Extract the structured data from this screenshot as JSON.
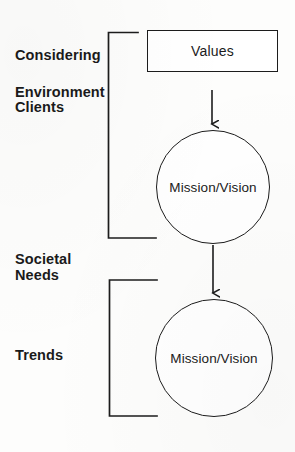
{
  "diagram": {
    "ink_color": "#1c1c1c",
    "background_color": "#fdfdfc",
    "labels": [
      {
        "id": "considering",
        "text": "Considering",
        "x": 15,
        "y": 47
      },
      {
        "id": "environment",
        "text": "Environment",
        "x": 15,
        "y": 84
      },
      {
        "id": "clients",
        "text": "Clients",
        "x": 15,
        "y": 99
      },
      {
        "id": "societal",
        "text": "Societal",
        "x": 15,
        "y": 251
      },
      {
        "id": "needs",
        "text": "Needs",
        "x": 15,
        "y": 267
      },
      {
        "id": "trends",
        "text": "Trends",
        "x": 15,
        "y": 347
      }
    ],
    "nodes": [
      {
        "id": "values-box",
        "shape": "rectangle",
        "text": "Values",
        "x": 147,
        "y": 30,
        "width": 131,
        "height": 42
      },
      {
        "id": "mission-vision-circle-1",
        "shape": "circle",
        "text": "Mission/Vision",
        "cx": 213,
        "cy": 187,
        "r": 57
      },
      {
        "id": "mission-vision-circle-2",
        "shape": "circle",
        "text": "Mission/Vision",
        "cx": 214,
        "cy": 358,
        "r": 59
      }
    ],
    "arrows": [
      {
        "id": "arrow-values-to-circle1",
        "from": "values-box",
        "to": "mission-vision-circle-1",
        "x": 212,
        "y1": 90,
        "y2": 128
      },
      {
        "id": "arrow-circle1-to-circle2",
        "from": "mission-vision-circle-1",
        "to": "mission-vision-circle-2",
        "x": 213,
        "y1": 245,
        "y2": 297
      }
    ],
    "brackets": [
      {
        "id": "bracket-upper",
        "groups": [
          "Considering",
          "Environment",
          "Clients"
        ],
        "x": 108,
        "y_top": 32,
        "y_bottom": 238,
        "stub_top_x2": 138,
        "stub_bottom_x2": 156
      },
      {
        "id": "bracket-lower",
        "groups": [
          "Societal Needs",
          "Trends"
        ],
        "x": 109,
        "y_top": 280,
        "y_bottom": 416,
        "stub_top_x2": 157,
        "stub_bottom_x2": 157
      }
    ]
  }
}
